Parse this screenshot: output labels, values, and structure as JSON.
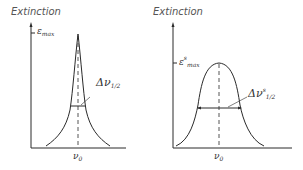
{
  "panels": [
    {
      "id": "narrow",
      "title": "Extinction",
      "ymax_label": "ε",
      "ymax_sub": "max",
      "ymax_sup": "",
      "width_label": "Δν",
      "width_sub": "1/2",
      "width_sup": "",
      "center_label": "ν",
      "center_sub": "0"
    },
    {
      "id": "broad",
      "title": "Extinction",
      "ymax_label": "ε",
      "ymax_sub": "max",
      "ymax_sup": "s",
      "width_label": "Δν",
      "width_sub": "1/2",
      "width_sup": "s",
      "center_label": "ν",
      "center_sub": "0"
    }
  ],
  "colors": {
    "line": "#2a2a2a",
    "text": "#333333"
  }
}
